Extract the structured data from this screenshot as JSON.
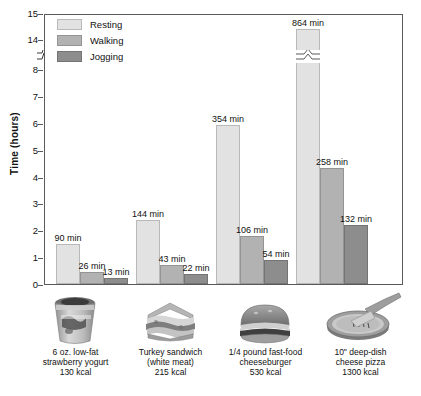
{
  "chart_data": {
    "type": "bar",
    "title": "",
    "xlabel": "",
    "ylabel": "Time (hours)",
    "ylim": [
      0,
      15
    ],
    "grid": false,
    "legend_position": "top-left",
    "axis_break": {
      "from": 8,
      "to": 14,
      "label": "y-axis break"
    },
    "y_ticks": [
      "0",
      "1",
      "2",
      "3",
      "4",
      "5",
      "6",
      "7",
      "8",
      "14",
      "15"
    ],
    "categories": [
      "6 oz. low-fat strawberry yogurt 130 kcal",
      "Turkey sandwich (white meat) 215 kcal",
      "1/4 pound fast-food cheeseburger 530 kcal",
      "10\" deep-dish cheese pizza 1300 kcal"
    ],
    "series": [
      {
        "name": "Resting",
        "color": "#e2e2e2",
        "values_min": [
          90,
          144,
          354,
          864
        ],
        "values_hours": [
          1.5,
          2.4,
          5.9,
          14.4
        ]
      },
      {
        "name": "Walking",
        "color": "#b2b2b2",
        "values_min": [
          26,
          43,
          106,
          258
        ],
        "values_hours": [
          0.43,
          0.72,
          1.77,
          4.3
        ]
      },
      {
        "name": "Jogging",
        "color": "#8d8d8d",
        "values_min": [
          13,
          22,
          54,
          132
        ],
        "values_hours": [
          0.22,
          0.37,
          0.9,
          2.2
        ]
      }
    ],
    "data_labels": [
      [
        "90 min",
        "26 min",
        "13 min"
      ],
      [
        "144 min",
        "43 min",
        "22 min"
      ],
      [
        "354 min",
        "106 min",
        "54 min"
      ],
      [
        "864 min",
        "258 min",
        "132 min"
      ]
    ]
  },
  "axis": {
    "y_title": "Time (hours)",
    "ticks": [
      {
        "label": "15",
        "value": 15
      },
      {
        "label": "14",
        "value": 14
      },
      {
        "label": "8",
        "value": 8
      },
      {
        "label": "7",
        "value": 7
      },
      {
        "label": "6",
        "value": 6
      },
      {
        "label": "5",
        "value": 5
      },
      {
        "label": "4",
        "value": 4
      },
      {
        "label": "3",
        "value": 3
      },
      {
        "label": "2",
        "value": 2
      },
      {
        "label": "1",
        "value": 1
      },
      {
        "label": "0",
        "value": 0
      }
    ]
  },
  "legend": {
    "items": [
      {
        "key": "resting",
        "label": "Resting"
      },
      {
        "key": "walking",
        "label": "Walking"
      },
      {
        "key": "jogging",
        "label": "Jogging"
      }
    ]
  },
  "foods": [
    {
      "icon": "yogurt-cup-icon",
      "line1": "6 oz. low-fat",
      "line2": "strawberry yogurt",
      "line3": "130 kcal"
    },
    {
      "icon": "turkey-sandwich-icon",
      "line1": "Turkey sandwich",
      "line2": "(white meat)",
      "line3": "215 kcal"
    },
    {
      "icon": "cheeseburger-icon",
      "line1": "1/4 pound fast-food",
      "line2": "cheeseburger",
      "line3": "530 kcal"
    },
    {
      "icon": "deep-dish-pizza-icon",
      "line1": "10\" deep-dish",
      "line2": "cheese pizza",
      "line3": "1300 kcal"
    }
  ]
}
